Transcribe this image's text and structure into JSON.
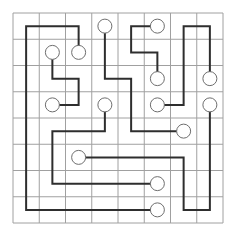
{
  "puzzle": {
    "type": "path-connection-grid",
    "rows": 8,
    "cols": 8,
    "origin": [
      13,
      13
    ],
    "cell_size": 26.25,
    "colors": {
      "background": "#ffffff",
      "grid_line": "#a0a0a0",
      "path": "#2e2e2e",
      "endpoint_fill": "#ffffff",
      "endpoint_stroke": "#6e6e6e"
    },
    "endpoint_radius": 7,
    "paths": [
      {
        "id": "A",
        "cells": [
          [
            1,
            2
          ],
          [
            0,
            2
          ],
          [
            0,
            0
          ],
          [
            7,
            0
          ],
          [
            7,
            5
          ]
        ]
      },
      {
        "id": "B",
        "cells": [
          [
            1,
            1
          ],
          [
            2,
            1
          ],
          [
            2,
            2
          ],
          [
            3,
            2
          ],
          [
            3,
            1
          ]
        ]
      },
      {
        "id": "C",
        "cells": [
          [
            0,
            3
          ],
          [
            2,
            3
          ],
          [
            2,
            4
          ],
          [
            4,
            4
          ],
          [
            4,
            6
          ]
        ]
      },
      {
        "id": "D",
        "cells": [
          [
            0,
            5
          ],
          [
            0,
            4
          ],
          [
            1,
            4
          ],
          [
            1,
            5
          ],
          [
            2,
            5
          ]
        ]
      },
      {
        "id": "E",
        "cells": [
          [
            2,
            7
          ],
          [
            0,
            7
          ],
          [
            0,
            6
          ],
          [
            3,
            6
          ],
          [
            3,
            5
          ]
        ]
      },
      {
        "id": "F",
        "cells": [
          [
            3,
            3
          ],
          [
            4,
            3
          ],
          [
            4,
            1
          ],
          [
            6,
            1
          ],
          [
            6,
            5
          ]
        ]
      },
      {
        "id": "G",
        "cells": [
          [
            5,
            2
          ],
          [
            5,
            6
          ],
          [
            7,
            6
          ],
          [
            7,
            7
          ],
          [
            3,
            7
          ]
        ]
      }
    ],
    "endpoints": [
      [
        1,
        2
      ],
      [
        7,
        5
      ],
      [
        1,
        1
      ],
      [
        3,
        1
      ],
      [
        0,
        3
      ],
      [
        4,
        6
      ],
      [
        0,
        5
      ],
      [
        2,
        5
      ],
      [
        2,
        7
      ],
      [
        3,
        5
      ],
      [
        3,
        3
      ],
      [
        6,
        5
      ],
      [
        5,
        2
      ],
      [
        3,
        7
      ]
    ]
  }
}
